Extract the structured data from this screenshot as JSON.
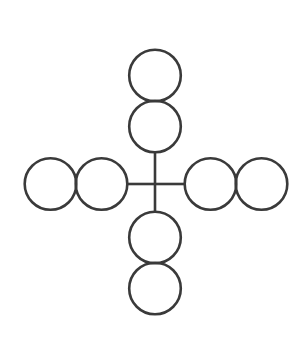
{
  "figure": {
    "canvas": {
      "width": 299,
      "height": 345
    },
    "background_color": "#ffffff",
    "stroke_color": "#3a3a3a",
    "circle_stroke_width": 2.6,
    "line_stroke_width": 2.6,
    "center": {
      "x": 155,
      "y": 184
    },
    "circle_radius": 25.8,
    "arms": [
      {
        "id": "arm-up",
        "direction": "up",
        "line": {
          "x1": 155,
          "y1": 184,
          "x2": 155,
          "y2": 152
        },
        "circles": [
          {
            "id": "circle-up-inner",
            "cx": 155,
            "cy": 126.5,
            "r": 25.8,
            "position": "inner"
          },
          {
            "id": "circle-up-outer",
            "cx": 155,
            "cy": 75.5,
            "r": 25.8,
            "position": "outer"
          }
        ]
      },
      {
        "id": "arm-down",
        "direction": "down",
        "line": {
          "x1": 155,
          "y1": 184,
          "x2": 155,
          "y2": 212
        },
        "circles": [
          {
            "id": "circle-down-inner",
            "cx": 155,
            "cy": 237.5,
            "r": 25.8,
            "position": "inner"
          },
          {
            "id": "circle-down-outer",
            "cx": 155,
            "cy": 288.5,
            "r": 25.8,
            "position": "outer"
          }
        ]
      },
      {
        "id": "arm-left",
        "direction": "left",
        "line": {
          "x1": 155,
          "y1": 184,
          "x2": 127,
          "y2": 184
        },
        "circles": [
          {
            "id": "circle-left-inner",
            "cx": 101.5,
            "cy": 184,
            "r": 25.8,
            "position": "inner"
          },
          {
            "id": "circle-left-outer",
            "cx": 50.5,
            "cy": 184,
            "r": 25.8,
            "position": "outer"
          }
        ]
      },
      {
        "id": "arm-right",
        "direction": "right",
        "line": {
          "x1": 155,
          "y1": 184,
          "x2": 185,
          "y2": 184
        },
        "circles": [
          {
            "id": "circle-right-inner",
            "cx": 210.5,
            "cy": 184,
            "r": 25.8,
            "position": "inner"
          },
          {
            "id": "circle-right-outer",
            "cx": 261.5,
            "cy": 184,
            "r": 25.8,
            "position": "outer"
          }
        ]
      }
    ],
    "counts": {
      "total_circles": 8,
      "circles_per_arm": 2,
      "total_arms": 4
    }
  }
}
